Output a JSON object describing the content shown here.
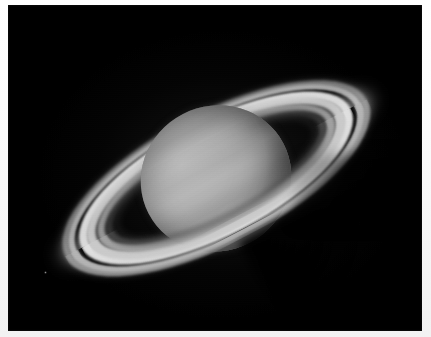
{
  "image": {
    "subject": "Saturn",
    "kind": "astrophotograph",
    "capture_style": "telescopic grayscale image of the planet Saturn with its ring system",
    "orientation": "rings tilted from lower-left to upper-right",
    "alt_text": "Grayscale telescopic photograph of Saturn showing the banded globe and the tilted ring system with the Cassini Division"
  },
  "frame": {
    "border_color": "#f7f7f7",
    "background_color": "#000000",
    "width": 431,
    "height": 337
  },
  "sky": {
    "color": "#000000",
    "label": "night sky background"
  },
  "globe": {
    "label": "Saturn globe",
    "center_x": 216,
    "center_y": 178,
    "radius_x": 76,
    "radius_y": 72,
    "base_color": "#9c9c9c",
    "bands": [
      {
        "name": "north-polar-hood",
        "tone": "#2e2e2e"
      },
      {
        "name": "north-temperate-belt",
        "tone": "#787878"
      },
      {
        "name": "north-equatorial-belt",
        "tone": "#808080"
      },
      {
        "name": "equatorial-zone",
        "tone": "#d4d4d4"
      },
      {
        "name": "south-equatorial-belt",
        "tone": "#848484"
      },
      {
        "name": "south-temperate-belt",
        "tone": "#767676"
      },
      {
        "name": "south-limb",
        "tone": "#2c2c2c"
      }
    ]
  },
  "rings": {
    "label": "Saturn ring system",
    "tilt_degrees": -27.5,
    "major_axis": 336,
    "minor_axis": 122,
    "components": [
      {
        "name": "a-ring",
        "tone": "#b2b2b2",
        "label": "A ring"
      },
      {
        "name": "cassini-division",
        "tone": "#060606",
        "label": "Cassini Division"
      },
      {
        "name": "b-ring",
        "tone": "#e2e2e2",
        "label": "B ring"
      },
      {
        "name": "c-ring",
        "tone": "#5c5c5c",
        "label": "C ring (crepe ring)"
      }
    ]
  },
  "shadow": {
    "label": "planet shadow cast on the rings",
    "tone": "#000000"
  },
  "moon": {
    "label": "faint moon",
    "x": 44,
    "y": 271,
    "tone": "#969696"
  }
}
